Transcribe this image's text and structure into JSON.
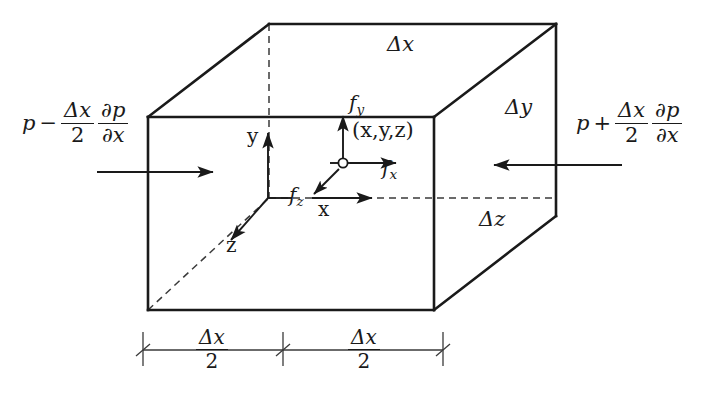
{
  "figure": {
    "stroke_color": "#1a1a1a",
    "background": "#ffffff"
  },
  "labels": {
    "pressure_left": {
      "base": "p",
      "operator": "−",
      "numerator": "Δx",
      "denominator": "2",
      "partial_num": "∂p",
      "partial_den": "∂x"
    },
    "pressure_right": {
      "base": "p",
      "operator": "+",
      "numerator": "Δx",
      "denominator": "2",
      "partial_num": "∂p",
      "partial_den": "∂x"
    },
    "delta_x_top": "Δx",
    "delta_y_right": "Δy",
    "delta_z_right": "Δz",
    "force_y": "f",
    "force_y_sub": "y",
    "force_x": "f",
    "force_x_sub": "x",
    "force_z": "f",
    "force_z_sub": "z",
    "point_coords": "(x,y,z)",
    "axis_y": "y",
    "axis_z": "z",
    "axis_x": "x",
    "dimension_left": {
      "numerator": "Δx",
      "denominator": "2"
    },
    "dimension_right": {
      "numerator": "Δx",
      "denominator": "2"
    }
  }
}
